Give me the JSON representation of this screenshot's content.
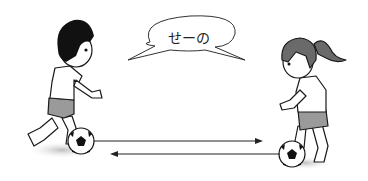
{
  "illustration": {
    "speech_bubble": {
      "text": "せーの"
    },
    "characters": [
      {
        "name": "boy",
        "description": "boy with black hair, white t-shirt, gray shorts, kicking soccer ball"
      },
      {
        "name": "girl",
        "description": "girl with ponytail, white t-shirt, gray shorts, with soccer ball"
      }
    ],
    "arrows": [
      {
        "direction": "right",
        "from": "boy",
        "to": "girl"
      },
      {
        "direction": "left",
        "from": "girl",
        "to": "boy"
      }
    ],
    "colors": {
      "line": "#1a1a1a",
      "shirt": "#ffffff",
      "shorts": "#9a9a9a",
      "hair_boy": "#111111",
      "hair_girl": "#6a6a6a",
      "shadow": "#cfcfcf"
    }
  }
}
